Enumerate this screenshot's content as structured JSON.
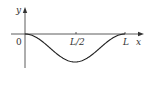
{
  "chart_data": {
    "type": "line",
    "title": "",
    "xlabel": "x",
    "ylabel": "y",
    "x_ticks": [
      "0",
      "L/2",
      "L"
    ],
    "series": [
      {
        "name": "y(x)",
        "description": "Single downward bump: zero at x=0 and x=L, minimum at x=L/2 with zero slope at endpoints",
        "x": [
          0,
          0.125,
          0.25,
          0.375,
          0.5,
          0.625,
          0.75,
          0.875,
          1.0
        ],
        "y": [
          0,
          -0.146,
          -0.5,
          -0.854,
          -1.0,
          -0.854,
          -0.5,
          -0.146,
          0
        ]
      }
    ],
    "x_unit": "L",
    "grid": false,
    "legend": null
  },
  "labels": {
    "origin": "0",
    "half": "L/2",
    "end": "L",
    "x_axis": "x",
    "y_axis": "y"
  },
  "colors": {
    "axis": "#333333",
    "curve": "#222222"
  }
}
